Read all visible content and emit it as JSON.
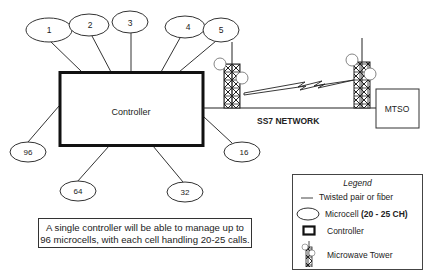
{
  "diagram": {
    "controller": {
      "label": "Controller"
    },
    "microcells": [
      {
        "id": "1",
        "label": "1",
        "cx": 43,
        "cy": 30,
        "x2": 82,
        "y2": 72
      },
      {
        "id": "2",
        "label": "2",
        "cx": 89,
        "cy": 25,
        "x2": 111,
        "y2": 72
      },
      {
        "id": "3",
        "label": "3",
        "cx": 130,
        "cy": 22,
        "x2": 131,
        "y2": 72
      },
      {
        "id": "4",
        "label": "4",
        "cx": 181,
        "cy": 27,
        "x2": 161,
        "y2": 72
      },
      {
        "id": "5",
        "label": "5",
        "cx": 222,
        "cy": 30,
        "x2": 179,
        "y2": 72
      },
      {
        "id": "16",
        "label": "16",
        "cx": 242,
        "cy": 152,
        "x2": 204,
        "y2": 117
      },
      {
        "id": "32",
        "label": "32",
        "cx": 185,
        "cy": 192,
        "x2": 153,
        "y2": 146
      },
      {
        "id": "64",
        "label": "64",
        "cx": 78,
        "cy": 192,
        "x2": 109,
        "y2": 146
      },
      {
        "id": "96",
        "label": "96",
        "cx": 28,
        "cy": 152,
        "x2": 59,
        "y2": 106
      }
    ],
    "network_label": "SS7 NETWORK",
    "mtso_label": "MTSO",
    "note": {
      "line1": "A single controller will be able to manage up to",
      "line2": "96 microcells, with each cell handling 20-25 calls."
    },
    "legend": {
      "title": "Legend",
      "items": [
        {
          "symbol": "line",
          "label": "Twisted pair or fiber",
          "suffix": ""
        },
        {
          "symbol": "ellipse",
          "label": "Microcell ",
          "suffix": "(20 - 25 CH)"
        },
        {
          "symbol": "box",
          "label": "Controller",
          "suffix": ""
        },
        {
          "symbol": "tower",
          "label": "Microwave Tower",
          "suffix": ""
        }
      ]
    },
    "colors": {
      "stroke": "#222222",
      "background": "#ffffff",
      "text": "#222222"
    }
  }
}
